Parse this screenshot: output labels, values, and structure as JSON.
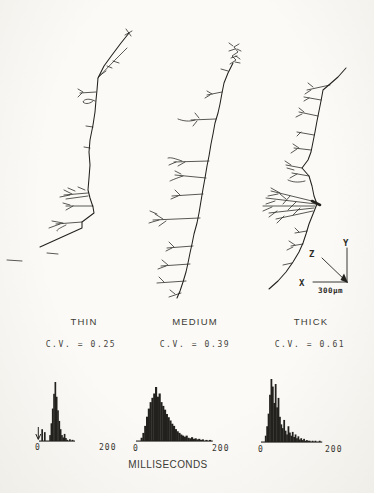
{
  "figure": {
    "columns": [
      {
        "label": "THIN",
        "cv_label": "C.V. = 0.25"
      },
      {
        "label": "MEDIUM",
        "cv_label": "C.V. = 0.39"
      },
      {
        "label": "THICK",
        "cv_label": "C.V. = 0.61"
      }
    ],
    "xaxis_label": "MILLISECONDS",
    "axis_key": {
      "y": "Y",
      "z": "Z",
      "x": "X",
      "scale": "300µm"
    }
  },
  "chart_data": [
    {
      "type": "histogram",
      "name": "THIN",
      "cv": 0.25,
      "xlabel": "MILLISECONDS",
      "xlim": [
        0,
        200
      ],
      "bin_width_ms": 4,
      "xticks": [
        "0",
        "200"
      ],
      "counts_rel": [
        0,
        20,
        0,
        15,
        0,
        0,
        0,
        10,
        30,
        55,
        80,
        100,
        75,
        52,
        34,
        20,
        10,
        6,
        12,
        5,
        2,
        0,
        3,
        0,
        2,
        0,
        0,
        0,
        0,
        0,
        0,
        0,
        0,
        0,
        0,
        0,
        0,
        0,
        0,
        0,
        0,
        0,
        0,
        0,
        0,
        0,
        0,
        0,
        0,
        0
      ],
      "annotations": [
        {
          "type": "down-arrow",
          "x_ms": -5
        }
      ]
    },
    {
      "type": "histogram",
      "name": "MEDIUM",
      "cv": 0.39,
      "xlabel": "MILLISECONDS",
      "xlim": [
        0,
        200
      ],
      "bin_width_ms": 4,
      "xticks": [
        "0",
        "200"
      ],
      "counts_rel": [
        0,
        0,
        6,
        15,
        28,
        45,
        60,
        72,
        80,
        88,
        100,
        82,
        88,
        72,
        65,
        58,
        50,
        44,
        38,
        32,
        28,
        22,
        18,
        15,
        12,
        10,
        8,
        10,
        6,
        5,
        7,
        4,
        5,
        3,
        4,
        2,
        3,
        0,
        2,
        0,
        2,
        0,
        0,
        0,
        0,
        0,
        0,
        0,
        0,
        0
      ],
      "annotations": []
    },
    {
      "type": "histogram",
      "name": "THICK",
      "cv": 0.61,
      "xlabel": "MILLISECONDS",
      "xlim": [
        0,
        200
      ],
      "bin_width_ms": 4,
      "xticks": [
        "0",
        "200"
      ],
      "counts_rel": [
        0,
        0,
        10,
        25,
        45,
        75,
        100,
        88,
        62,
        92,
        55,
        70,
        40,
        28,
        22,
        35,
        18,
        12,
        25,
        15,
        10,
        16,
        8,
        12,
        6,
        9,
        4,
        6,
        3,
        5,
        2,
        3,
        2,
        2,
        0,
        2,
        0,
        2,
        0,
        0,
        2,
        0,
        0,
        0,
        0,
        0,
        0,
        0,
        0,
        0
      ],
      "annotations": []
    }
  ],
  "colors": {
    "ink": "#22211d",
    "paper": "#fbfaf7"
  }
}
